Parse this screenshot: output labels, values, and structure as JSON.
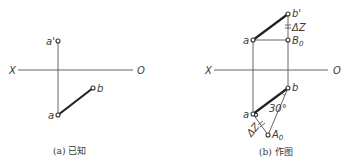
{
  "figure_a": {
    "caption": "(a) 已知",
    "axis": {
      "left_label": "X",
      "right_label": "O"
    },
    "points": {
      "a_prime": {
        "label": "a'"
      },
      "a": {
        "label": "a"
      },
      "b": {
        "label": "b"
      }
    }
  },
  "figure_b": {
    "caption": "(b) 作图",
    "axis": {
      "left_label": "X",
      "right_label": "O"
    },
    "points": {
      "a_prime": {
        "label": "a"
      },
      "b_prime": {
        "label": "b'"
      },
      "B0": {
        "label": "B",
        "sub": "0"
      },
      "a": {
        "label": "a"
      },
      "b": {
        "label": "b"
      },
      "A0": {
        "label": "A",
        "sub": "0"
      }
    },
    "annotations": {
      "delta_z_top": "ΔZ",
      "delta_z_bottom": "ΔZ",
      "angle": "30°"
    }
  },
  "colors": {
    "line": "#222222",
    "thin_line": "#555555",
    "text": "#3a3a3a"
  }
}
